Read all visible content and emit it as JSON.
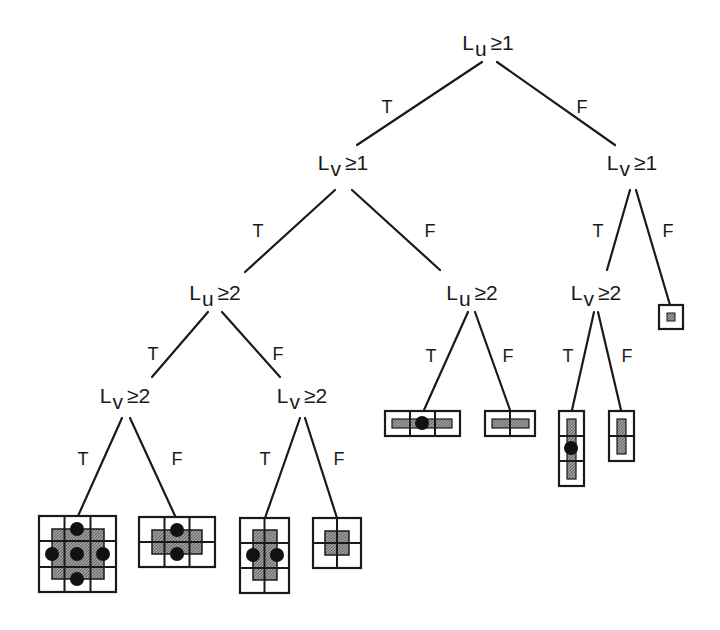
{
  "diagram": {
    "type": "decision-tree",
    "colors": {
      "line": "#1a1a1a",
      "cell_fill": "#8a8a8a",
      "dot": "#111111",
      "background": "#ffffff"
    },
    "nodes": [
      {
        "id": "n0",
        "var": "L",
        "sub": "u",
        "op": "≥",
        "val": "1",
        "x": 488,
        "y": 32
      },
      {
        "id": "n1",
        "var": "L",
        "sub": "v",
        "op": "≥",
        "val": "1",
        "x": 343,
        "y": 152
      },
      {
        "id": "n2",
        "var": "L",
        "sub": "v",
        "op": "≥",
        "val": "1",
        "x": 632,
        "y": 152
      },
      {
        "id": "n3",
        "var": "L",
        "sub": "u",
        "op": "≥",
        "val": "2",
        "x": 215,
        "y": 282
      },
      {
        "id": "n4",
        "var": "L",
        "sub": "u",
        "op": "≥",
        "val": "2",
        "x": 472,
        "y": 282
      },
      {
        "id": "n5",
        "var": "L",
        "sub": "v",
        "op": "≥",
        "val": "2",
        "x": 596,
        "y": 282
      },
      {
        "id": "n6",
        "var": "L",
        "sub": "v",
        "op": "≥",
        "val": "2",
        "x": 125,
        "y": 385
      },
      {
        "id": "n7",
        "var": "L",
        "sub": "v",
        "op": "≥",
        "val": "2",
        "x": 302,
        "y": 385
      }
    ],
    "branches": [
      {
        "label": "T",
        "x": 387,
        "y": 98
      },
      {
        "label": "F",
        "x": 582,
        "y": 98
      },
      {
        "label": "T",
        "x": 258,
        "y": 222
      },
      {
        "label": "F",
        "x": 430,
        "y": 222
      },
      {
        "label": "T",
        "x": 598,
        "y": 222
      },
      {
        "label": "F",
        "x": 668,
        "y": 222
      },
      {
        "label": "T",
        "x": 153,
        "y": 345
      },
      {
        "label": "F",
        "x": 278,
        "y": 345
      },
      {
        "label": "T",
        "x": 431,
        "y": 347
      },
      {
        "label": "F",
        "x": 508,
        "y": 347
      },
      {
        "label": "T",
        "x": 568,
        "y": 347
      },
      {
        "label": "F",
        "x": 627,
        "y": 347
      },
      {
        "label": "T",
        "x": 83,
        "y": 450
      },
      {
        "label": "F",
        "x": 177,
        "y": 450
      },
      {
        "label": "T",
        "x": 265,
        "y": 450
      },
      {
        "label": "F",
        "x": 339,
        "y": 450
      }
    ],
    "leaves": [
      {
        "id": "leaf-1",
        "desc": "3x3 grid, plus-shaped shaded region, 5 dots"
      },
      {
        "id": "leaf-2",
        "desc": "3x2 grid, horizontal shaded bar, 2 dots"
      },
      {
        "id": "leaf-3",
        "desc": "2x3 grid, vertical shaded bar, 2 dots"
      },
      {
        "id": "leaf-4",
        "desc": "2x2 grid, small shaded square"
      },
      {
        "id": "leaf-5",
        "desc": "3x1 grid, horizontal thin bar, 1 dot"
      },
      {
        "id": "leaf-6",
        "desc": "2x1 grid, horizontal thin bar"
      },
      {
        "id": "leaf-7",
        "desc": "1x3 grid, vertical thin bar, 1 dot"
      },
      {
        "id": "leaf-8",
        "desc": "1x2 grid, vertical thin bar"
      },
      {
        "id": "leaf-9",
        "desc": "1x1 cell, tiny shaded square"
      }
    ]
  }
}
